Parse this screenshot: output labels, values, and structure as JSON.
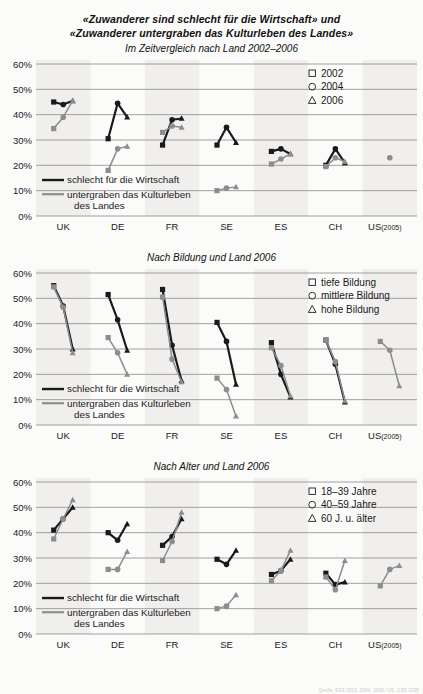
{
  "header": {
    "title_line1": "«Zuwanderer sind schlecht für die Wirtschaft» und",
    "title_line2": "«Zuwanderer untergraben das Kulturleben des Landes»"
  },
  "footer": {
    "credit": "Quelle: ESS 2002, 2004, 2006 / US: GSS 2005"
  },
  "common": {
    "series_black_label": "schlecht für die Wirtschaft",
    "series_gray_label_line1": "untergraben das Kulturleben",
    "series_gray_label_line2": "des Landes",
    "color_black": "#1a1a1a",
    "color_gray": "#8d8d8d",
    "color_band": "#f0efed",
    "color_grid": "#8a8a8a",
    "categories": [
      "UK",
      "DE",
      "FR",
      "SE",
      "ES",
      "CH",
      "US"
    ],
    "last_category_note": "(2005)",
    "yticks": [
      "0%",
      "10%",
      "20%",
      "30%",
      "40%",
      "50%",
      "60%"
    ]
  },
  "chart_data": [
    {
      "id": "chart1",
      "type": "line",
      "title": "Im Zeitvergleich nach Land 2002–2006",
      "xlabel": "",
      "ylabel": "",
      "ylim": [
        0,
        60
      ],
      "grid": true,
      "legend_position": "top-right",
      "legend": [
        {
          "marker": "square",
          "label": "2002"
        },
        {
          "marker": "circle",
          "label": "2004"
        },
        {
          "marker": "triangle",
          "label": "2006"
        }
      ],
      "categories": [
        "UK",
        "DE",
        "FR",
        "SE",
        "ES",
        "CH",
        "US"
      ],
      "series": [
        {
          "name": "schlecht für die Wirtschaft",
          "color": "#1a1a1a",
          "groups": [
            {
              "category": "UK",
              "values": [
                45.0,
                44.0,
                45.5
              ]
            },
            {
              "category": "DE",
              "values": [
                30.5,
                44.5,
                39.0
              ]
            },
            {
              "category": "FR",
              "values": [
                28.0,
                38.0,
                38.5
              ]
            },
            {
              "category": "SE",
              "values": [
                28.0,
                35.0,
                29.0
              ]
            },
            {
              "category": "ES",
              "values": [
                25.5,
                26.5,
                24.5
              ]
            },
            {
              "category": "CH",
              "values": [
                20.0,
                26.5,
                21.0
              ]
            },
            {
              "category": "US",
              "values": [
                null,
                null,
                null
              ]
            }
          ]
        },
        {
          "name": "untergraben das Kulturleben des Landes",
          "color": "#8d8d8d",
          "groups": [
            {
              "category": "UK",
              "values": [
                34.5,
                39.0,
                45.5
              ]
            },
            {
              "category": "DE",
              "values": [
                18.0,
                26.5,
                27.5
              ]
            },
            {
              "category": "FR",
              "values": [
                33.0,
                35.5,
                35.0
              ]
            },
            {
              "category": "SE",
              "values": [
                10.0,
                11.0,
                11.5
              ]
            },
            {
              "category": "ES",
              "values": [
                20.5,
                22.5,
                24.5
              ]
            },
            {
              "category": "CH",
              "values": [
                19.5,
                23.0,
                21.5
              ]
            },
            {
              "category": "US",
              "values": [
                null,
                23.0,
                null
              ]
            }
          ]
        }
      ]
    },
    {
      "id": "chart2",
      "type": "line",
      "title": "Nach Bildung und Land 2006",
      "xlabel": "",
      "ylabel": "",
      "ylim": [
        0,
        60
      ],
      "grid": true,
      "legend_position": "top-right",
      "legend": [
        {
          "marker": "square",
          "label": "tiefe Bildung"
        },
        {
          "marker": "circle",
          "label": "mittlere Bildung"
        },
        {
          "marker": "triangle",
          "label": "hohe Bildung"
        }
      ],
      "categories": [
        "UK",
        "DE",
        "FR",
        "SE",
        "ES",
        "CH",
        "US"
      ],
      "series": [
        {
          "name": "schlecht für die Wirtschaft",
          "color": "#1a1a1a",
          "groups": [
            {
              "category": "UK",
              "values": [
                55.0,
                47.0,
                30.0
              ]
            },
            {
              "category": "DE",
              "values": [
                51.5,
                41.5,
                29.5
              ]
            },
            {
              "category": "FR",
              "values": [
                53.5,
                31.5,
                17.5
              ]
            },
            {
              "category": "SE",
              "values": [
                40.5,
                33.0,
                16.0
              ]
            },
            {
              "category": "ES",
              "values": [
                32.5,
                20.0,
                11.0
              ]
            },
            {
              "category": "CH",
              "values": [
                33.5,
                24.0,
                9.0
              ]
            },
            {
              "category": "US",
              "values": [
                null,
                null,
                null
              ]
            }
          ]
        },
        {
          "name": "untergraben das Kulturleben des Landes",
          "color": "#8d8d8d",
          "groups": [
            {
              "category": "UK",
              "values": [
                54.5,
                46.5,
                28.5
              ]
            },
            {
              "category": "DE",
              "values": [
                34.5,
                28.5,
                20.0
              ]
            },
            {
              "category": "FR",
              "values": [
                50.5,
                26.0,
                17.0
              ]
            },
            {
              "category": "SE",
              "values": [
                18.5,
                14.0,
                3.5
              ]
            },
            {
              "category": "ES",
              "values": [
                30.5,
                23.5,
                11.5
              ]
            },
            {
              "category": "CH",
              "values": [
                33.5,
                25.0,
                9.5
              ]
            },
            {
              "category": "US",
              "values": [
                33.0,
                29.5,
                15.5
              ]
            }
          ]
        }
      ]
    },
    {
      "id": "chart3",
      "type": "line",
      "title": "Nach Alter und Land 2006",
      "xlabel": "",
      "ylabel": "",
      "ylim": [
        0,
        60
      ],
      "grid": true,
      "legend_position": "top-right",
      "legend": [
        {
          "marker": "square",
          "label": "18–39 Jahre"
        },
        {
          "marker": "circle",
          "label": "40–59 Jahre"
        },
        {
          "marker": "triangle",
          "label": "60 J. u. älter"
        }
      ],
      "categories": [
        "UK",
        "DE",
        "FR",
        "SE",
        "ES",
        "CH",
        "US"
      ],
      "series": [
        {
          "name": "schlecht für die Wirtschaft",
          "color": "#1a1a1a",
          "groups": [
            {
              "category": "UK",
              "values": [
                41.0,
                45.5,
                50.0
              ]
            },
            {
              "category": "DE",
              "values": [
                40.0,
                37.0,
                43.5
              ]
            },
            {
              "category": "FR",
              "values": [
                35.0,
                38.5,
                45.5
              ]
            },
            {
              "category": "SE",
              "values": [
                29.5,
                27.5,
                33.0
              ]
            },
            {
              "category": "ES",
              "values": [
                23.5,
                25.0,
                29.5
              ]
            },
            {
              "category": "CH",
              "values": [
                24.0,
                19.5,
                20.5
              ]
            },
            {
              "category": "US",
              "values": [
                null,
                null,
                null
              ]
            }
          ]
        },
        {
          "name": "untergraben das Kulturleben des Landes",
          "color": "#8d8d8d",
          "groups": [
            {
              "category": "UK",
              "values": [
                37.5,
                45.5,
                53.0
              ]
            },
            {
              "category": "DE",
              "values": [
                25.5,
                25.5,
                32.5
              ]
            },
            {
              "category": "FR",
              "values": [
                29.0,
                36.5,
                48.0
              ]
            },
            {
              "category": "SE",
              "values": [
                10.0,
                11.0,
                15.5
              ]
            },
            {
              "category": "ES",
              "values": [
                21.0,
                25.0,
                33.0
              ]
            },
            {
              "category": "CH",
              "values": [
                22.5,
                17.5,
                29.0
              ]
            },
            {
              "category": "US",
              "values": [
                19.0,
                25.5,
                27.0
              ]
            }
          ]
        }
      ]
    }
  ]
}
